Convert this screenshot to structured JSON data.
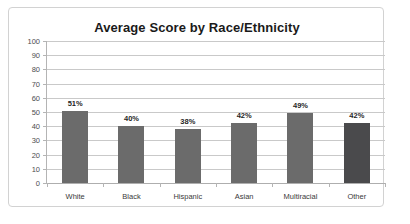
{
  "chart_data": {
    "type": "bar",
    "title": "Average Score by Race/Ethnicity",
    "xlabel": "",
    "ylabel": "",
    "ylim": [
      0,
      100
    ],
    "ytick_step": 10,
    "ytick_labels": [
      "100",
      "90",
      "80",
      "70",
      "60",
      "50",
      "40",
      "30",
      "20",
      "10",
      "0"
    ],
    "grid": true,
    "legend": false,
    "categories": [
      "White",
      "Black",
      "Hispanic",
      "Asian",
      "Multiracial",
      "Other"
    ],
    "values": [
      51,
      40,
      38,
      42,
      49,
      42
    ],
    "data_labels": [
      "51%",
      "40%",
      "38%",
      "42%",
      "49%",
      "42%"
    ],
    "bar_colors": [
      "#6b6b6b",
      "#6b6b6b",
      "#6b6b6b",
      "#6b6b6b",
      "#6b6b6b",
      "#4a4a4c"
    ],
    "accent_color": "#6b6b6b",
    "highlight_color": "#4a4a4c",
    "gridline_color": "#c9c9c9",
    "axis_color": "#b4b4b4",
    "background_color": "#ffffff",
    "border_color": "#d2d2d2"
  }
}
